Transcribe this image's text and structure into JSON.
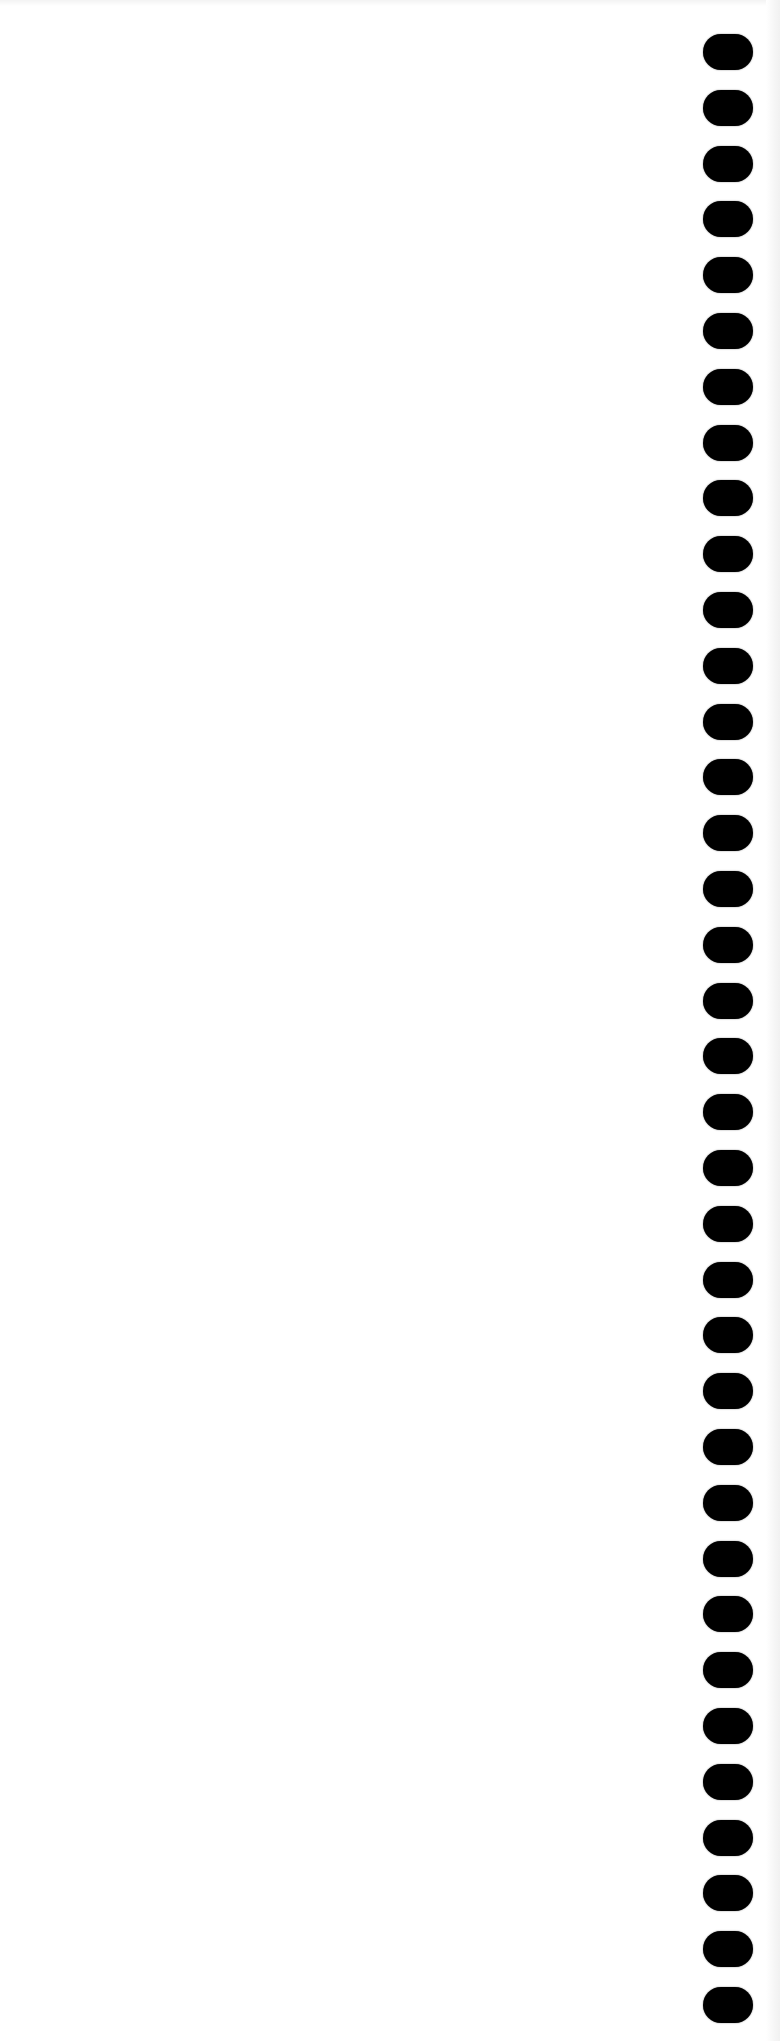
{
  "page": {
    "type": "blank-scanned-sheet",
    "background_color": "#ffffff",
    "text_content": ""
  },
  "binding_holes": {
    "count": 36,
    "side": "right",
    "color": "#000000",
    "shape": "rounded-rectangle",
    "x_left": 703,
    "width": 50,
    "height": 36,
    "first_center_y": 52,
    "pitch": 55.8
  }
}
